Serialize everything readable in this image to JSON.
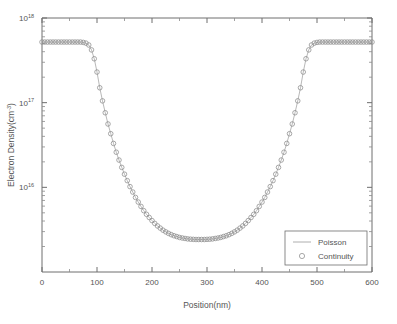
{
  "chart_data": {
    "type": "line",
    "title": "",
    "xlabel": "Position(nm)",
    "ylabel": "Electron Density(cm",
    "ylabel_exponent": "-3",
    "ylabel_suffix": ")",
    "xlim": [
      0,
      600
    ],
    "ylim": [
      1000000000000000.0,
      1e+18
    ],
    "yscale": "log",
    "xscale": "linear",
    "grid": false,
    "xticks": [
      0,
      100,
      200,
      300,
      400,
      500,
      600
    ],
    "xticklabels": [
      "0",
      "100",
      "200",
      "300",
      "400",
      "500",
      "600"
    ],
    "xminorticks": [
      50,
      150,
      250,
      350,
      450,
      550
    ],
    "yticks": [
      1e+16,
      1e+17,
      1e+18
    ],
    "yticklabels": [
      "10",
      "10",
      "10"
    ],
    "yticklabel_exponents": [
      "16",
      "17",
      "18"
    ],
    "legend_position": "lower right",
    "series": [
      {
        "name": "Poisson",
        "style": "line",
        "color": "#9a9a9a"
      },
      {
        "name": "Continuity",
        "style": "open-circle-marker",
        "color": "#8c8c8c"
      }
    ],
    "x": [
      0,
      5,
      10,
      15,
      20,
      25,
      30,
      35,
      40,
      45,
      50,
      55,
      60,
      65,
      70,
      75,
      80,
      85,
      90,
      95,
      100,
      105,
      110,
      115,
      120,
      125,
      130,
      135,
      140,
      145,
      150,
      155,
      160,
      165,
      170,
      175,
      180,
      185,
      190,
      195,
      200,
      205,
      210,
      215,
      220,
      225,
      230,
      235,
      240,
      245,
      250,
      255,
      260,
      265,
      270,
      275,
      280,
      285,
      290,
      295,
      300,
      305,
      310,
      315,
      320,
      325,
      330,
      335,
      340,
      345,
      350,
      355,
      360,
      365,
      370,
      375,
      380,
      385,
      390,
      395,
      400,
      405,
      410,
      415,
      420,
      425,
      430,
      435,
      440,
      445,
      450,
      455,
      460,
      465,
      470,
      475,
      480,
      485,
      490,
      495,
      500,
      505,
      510,
      515,
      520,
      525,
      530,
      535,
      540,
      545,
      550,
      555,
      560,
      565,
      570,
      575,
      580,
      585,
      590,
      595,
      600
    ],
    "y": [
      5.2e+17,
      5.2e+17,
      5.2e+17,
      5.2e+17,
      5.2e+17,
      5.2e+17,
      5.2e+17,
      5.2e+17,
      5.2e+17,
      5.2e+17,
      5.2e+17,
      5.2e+17,
      5.2e+17,
      5.2e+17,
      5.2e+17,
      5.15e+17,
      5.05e+17,
      4.8e+17,
      4.2e+17,
      3.3e+17,
      2.3e+17,
      1.5e+17,
      1.05e+17,
      7.6e+16,
      5.6e+16,
      4.3e+16,
      3.3e+16,
      2.6e+16,
      2.1e+16,
      1.72e+16,
      1.43e+16,
      1.2e+16,
      1.02e+16,
      8800000000000000.0,
      7600000000000000.0,
      6700000000000000.0,
      5950000000000000.0,
      5300000000000000.0,
      4800000000000000.0,
      4400000000000000.0,
      4050000000000000.0,
      3750000000000000.0,
      3500000000000000.0,
      3300000000000000.0,
      3120000000000000.0,
      2980000000000000.0,
      2860000000000000.0,
      2760000000000000.0,
      2680000000000000.0,
      2620000000000000.0,
      2560000000000000.0,
      2520000000000000.0,
      2490000000000000.0,
      2460000000000000.0,
      2440000000000000.0,
      2430000000000000.0,
      2420000000000000.0,
      2420000000000000.0,
      2420000000000000.0,
      2420000000000000.0,
      2430000000000000.0,
      2440000000000000.0,
      2460000000000000.0,
      2490000000000000.0,
      2520000000000000.0,
      2560000000000000.0,
      2620000000000000.0,
      2680000000000000.0,
      2760000000000000.0,
      2860000000000000.0,
      2980000000000000.0,
      3120000000000000.0,
      3300000000000000.0,
      3500000000000000.0,
      3750000000000000.0,
      4050000000000000.0,
      4400000000000000.0,
      4800000000000000.0,
      5300000000000000.0,
      5950000000000000.0,
      6700000000000000.0,
      7600000000000000.0,
      8800000000000000.0,
      1.02e+16,
      1.2e+16,
      1.43e+16,
      1.72e+16,
      2.1e+16,
      2.6e+16,
      3.3e+16,
      4.3e+16,
      5.6e+16,
      7.6e+16,
      1.05e+17,
      1.5e+17,
      2.3e+17,
      3.3e+17,
      4.2e+17,
      4.8e+17,
      5.05e+17,
      5.15e+17,
      5.2e+17,
      5.2e+17,
      5.2e+17,
      5.2e+17,
      5.2e+17,
      5.2e+17,
      5.2e+17,
      5.2e+17,
      5.2e+17,
      5.2e+17,
      5.2e+17,
      5.2e+17,
      5.2e+17,
      5.2e+17,
      5.2e+17,
      5.2e+17,
      5.2e+17,
      5.2e+17,
      5.2e+17,
      5.2e+17
    ],
    "annotations": {
      "plateau_value": 5.2e+17,
      "minimum_value": 2420000000000000.0,
      "minimum_position": 295
    }
  }
}
